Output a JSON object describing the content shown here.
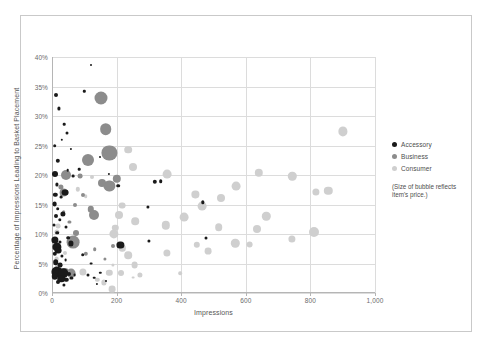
{
  "chart_data": {
    "type": "scatter",
    "title": "",
    "xlabel": "Impressions",
    "ylabel": "Percentage of Impressions Leading to Basket Placement",
    "xlim": [
      0,
      1000
    ],
    "ylim": [
      0,
      0.4
    ],
    "xticks": [
      0,
      200,
      400,
      600,
      800,
      1000
    ],
    "xtick_labels": [
      "0",
      "200",
      "400",
      "600",
      "800",
      "1,000"
    ],
    "yticks": [
      0,
      5,
      10,
      15,
      20,
      25,
      30,
      35,
      40
    ],
    "ytick_labels": [
      "0%",
      "5%",
      "10%",
      "15%",
      "20%",
      "25%",
      "30%",
      "35%",
      "40%"
    ],
    "grid": true,
    "legend_position": "right",
    "size_encoding": "bubble radius reflects item's price",
    "series": [
      {
        "name": "Accessory",
        "color": "#1a1a1a",
        "points": [
          {
            "x": 12,
            "y": 33.5,
            "r": 2.0
          },
          {
            "x": 22,
            "y": 31.3,
            "r": 1.6
          },
          {
            "x": 38,
            "y": 28.6,
            "r": 1.3
          },
          {
            "x": 45,
            "y": 27.2,
            "r": 1.5
          },
          {
            "x": 30,
            "y": 26.0,
            "r": 1.2
          },
          {
            "x": 8,
            "y": 25.0,
            "r": 1.8
          },
          {
            "x": 18,
            "y": 22.4,
            "r": 2.2
          },
          {
            "x": 8,
            "y": 20.2,
            "r": 3.0
          },
          {
            "x": 48,
            "y": 20.8,
            "r": 1.3
          },
          {
            "x": 14,
            "y": 18.4,
            "r": 1.6
          },
          {
            "x": 10,
            "y": 16.6,
            "r": 2.2
          },
          {
            "x": 40,
            "y": 17.0,
            "r": 3.4
          },
          {
            "x": 28,
            "y": 16.2,
            "r": 1.4
          },
          {
            "x": 8,
            "y": 15.1,
            "r": 2.4
          },
          {
            "x": 18,
            "y": 14.3,
            "r": 1.8
          },
          {
            "x": 34,
            "y": 13.4,
            "r": 2.6
          },
          {
            "x": 12,
            "y": 13.0,
            "r": 2.0
          },
          {
            "x": 24,
            "y": 12.4,
            "r": 1.7
          },
          {
            "x": 6,
            "y": 11.6,
            "r": 1.5
          },
          {
            "x": 16,
            "y": 10.2,
            "r": 1.8
          },
          {
            "x": 10,
            "y": 9.0,
            "r": 3.6
          },
          {
            "x": 26,
            "y": 8.6,
            "r": 1.5
          },
          {
            "x": 14,
            "y": 7.8,
            "r": 4.6
          },
          {
            "x": 20,
            "y": 7.2,
            "r": 3.4
          },
          {
            "x": 8,
            "y": 6.6,
            "r": 2.2
          },
          {
            "x": 30,
            "y": 6.3,
            "r": 1.6
          },
          {
            "x": 42,
            "y": 5.6,
            "r": 1.4
          },
          {
            "x": 12,
            "y": 5.2,
            "r": 2.8
          },
          {
            "x": 24,
            "y": 4.7,
            "r": 2.4
          },
          {
            "x": 16,
            "y": 3.6,
            "r": 5.6
          },
          {
            "x": 34,
            "y": 3.4,
            "r": 4.8
          },
          {
            "x": 52,
            "y": 3.2,
            "r": 2.0
          },
          {
            "x": 8,
            "y": 2.8,
            "r": 3.2
          },
          {
            "x": 28,
            "y": 2.4,
            "r": 3.8
          },
          {
            "x": 44,
            "y": 2.2,
            "r": 2.2
          },
          {
            "x": 60,
            "y": 2.6,
            "r": 1.6
          },
          {
            "x": 70,
            "y": 3.0,
            "r": 1.4
          },
          {
            "x": 20,
            "y": 1.8,
            "r": 2.0
          },
          {
            "x": 38,
            "y": 1.4,
            "r": 1.6
          },
          {
            "x": 95,
            "y": 6.5,
            "r": 1.8
          },
          {
            "x": 120,
            "y": 5.0,
            "r": 1.4
          },
          {
            "x": 112,
            "y": 3.0,
            "r": 1.5
          },
          {
            "x": 130,
            "y": 2.6,
            "r": 1.3
          },
          {
            "x": 150,
            "y": 3.4,
            "r": 1.2
          },
          {
            "x": 140,
            "y": 1.6,
            "r": 1.1
          },
          {
            "x": 168,
            "y": 2.0,
            "r": 1.0
          },
          {
            "x": 212,
            "y": 8.2,
            "r": 3.6
          },
          {
            "x": 205,
            "y": 18.2,
            "r": 1.8
          },
          {
            "x": 318,
            "y": 18.8,
            "r": 2.2
          },
          {
            "x": 336,
            "y": 18.9,
            "r": 1.8
          },
          {
            "x": 296,
            "y": 14.6,
            "r": 1.6
          },
          {
            "x": 300,
            "y": 8.8,
            "r": 1.6
          },
          {
            "x": 466,
            "y": 15.4,
            "r": 1.7
          },
          {
            "x": 478,
            "y": 9.3,
            "r": 1.5
          },
          {
            "x": 66,
            "y": 19.8,
            "r": 1.4
          },
          {
            "x": 84,
            "y": 21.0,
            "r": 1.3
          },
          {
            "x": 100,
            "y": 34.2,
            "r": 1.2
          },
          {
            "x": 58,
            "y": 24.4,
            "r": 1.1
          },
          {
            "x": 120,
            "y": 38.6,
            "r": 1.0
          },
          {
            "x": 150,
            "y": 23.0,
            "r": 1.0
          },
          {
            "x": 176,
            "y": 20.2,
            "r": 1.1
          },
          {
            "x": 58,
            "y": 8.4,
            "r": 2.6
          },
          {
            "x": 50,
            "y": 9.4,
            "r": 1.8
          },
          {
            "x": 44,
            "y": 11.2,
            "r": 1.5
          }
        ]
      },
      {
        "name": "Business",
        "color": "#8c8c8c",
        "points": [
          {
            "x": 152,
            "y": 33.0,
            "r": 6.5
          },
          {
            "x": 166,
            "y": 27.8,
            "r": 5.8
          },
          {
            "x": 178,
            "y": 23.7,
            "r": 7.6
          },
          {
            "x": 112,
            "y": 22.6,
            "r": 6.0
          },
          {
            "x": 42,
            "y": 20.0,
            "r": 5.0
          },
          {
            "x": 200,
            "y": 19.4,
            "r": 4.2
          },
          {
            "x": 178,
            "y": 18.2,
            "r": 5.6
          },
          {
            "x": 155,
            "y": 18.6,
            "r": 4.0
          },
          {
            "x": 36,
            "y": 17.0,
            "r": 4.4
          },
          {
            "x": 28,
            "y": 18.0,
            "r": 2.6
          },
          {
            "x": 130,
            "y": 13.2,
            "r": 5.0
          },
          {
            "x": 120,
            "y": 14.2,
            "r": 3.2
          },
          {
            "x": 66,
            "y": 8.6,
            "r": 6.4
          },
          {
            "x": 74,
            "y": 10.2,
            "r": 3.0
          },
          {
            "x": 60,
            "y": 3.4,
            "r": 4.4
          },
          {
            "x": 40,
            "y": 3.6,
            "r": 4.0
          },
          {
            "x": 96,
            "y": 16.6,
            "r": 2.0
          },
          {
            "x": 104,
            "y": 6.6,
            "r": 2.2
          },
          {
            "x": 88,
            "y": 19.8,
            "r": 2.4
          },
          {
            "x": 72,
            "y": 15.0,
            "r": 2.0
          },
          {
            "x": 132,
            "y": 7.4,
            "r": 1.8
          },
          {
            "x": 164,
            "y": 5.8,
            "r": 1.6
          },
          {
            "x": 190,
            "y": 8.0,
            "r": 2.0
          },
          {
            "x": 36,
            "y": 13.8,
            "r": 1.8
          },
          {
            "x": 54,
            "y": 12.0,
            "r": 1.6
          }
        ]
      },
      {
        "name": "Consumer",
        "color": "#cfcfcf",
        "points": [
          {
            "x": 900,
            "y": 27.4,
            "r": 4.6
          },
          {
            "x": 640,
            "y": 20.4,
            "r": 4.2
          },
          {
            "x": 744,
            "y": 19.8,
            "r": 4.2
          },
          {
            "x": 356,
            "y": 20.1,
            "r": 4.4
          },
          {
            "x": 236,
            "y": 24.3,
            "r": 3.8
          },
          {
            "x": 252,
            "y": 21.3,
            "r": 4.0
          },
          {
            "x": 570,
            "y": 18.1,
            "r": 4.4
          },
          {
            "x": 816,
            "y": 17.2,
            "r": 3.6
          },
          {
            "x": 856,
            "y": 17.3,
            "r": 4.2
          },
          {
            "x": 444,
            "y": 16.7,
            "r": 3.6
          },
          {
            "x": 524,
            "y": 16.1,
            "r": 4.0
          },
          {
            "x": 464,
            "y": 14.7,
            "r": 4.4
          },
          {
            "x": 216,
            "y": 14.8,
            "r": 3.4
          },
          {
            "x": 664,
            "y": 13.0,
            "r": 4.2
          },
          {
            "x": 408,
            "y": 12.8,
            "r": 4.4
          },
          {
            "x": 258,
            "y": 12.2,
            "r": 3.8
          },
          {
            "x": 206,
            "y": 13.3,
            "r": 4.0
          },
          {
            "x": 352,
            "y": 11.5,
            "r": 4.2
          },
          {
            "x": 516,
            "y": 11.2,
            "r": 3.8
          },
          {
            "x": 636,
            "y": 10.9,
            "r": 4.0
          },
          {
            "x": 812,
            "y": 10.4,
            "r": 5.0
          },
          {
            "x": 196,
            "y": 11.0,
            "r": 3.2
          },
          {
            "x": 192,
            "y": 10.0,
            "r": 4.6
          },
          {
            "x": 744,
            "y": 9.2,
            "r": 3.6
          },
          {
            "x": 568,
            "y": 8.4,
            "r": 4.2
          },
          {
            "x": 612,
            "y": 8.2,
            "r": 3.4
          },
          {
            "x": 448,
            "y": 8.2,
            "r": 3.2
          },
          {
            "x": 484,
            "y": 7.1,
            "r": 3.4
          },
          {
            "x": 356,
            "y": 6.8,
            "r": 3.6
          },
          {
            "x": 236,
            "y": 6.4,
            "r": 3.8
          },
          {
            "x": 218,
            "y": 7.6,
            "r": 3.2
          },
          {
            "x": 256,
            "y": 4.7,
            "r": 3.4
          },
          {
            "x": 214,
            "y": 3.4,
            "r": 3.0
          },
          {
            "x": 272,
            "y": 3.0,
            "r": 2.6
          },
          {
            "x": 178,
            "y": 3.4,
            "r": 3.2
          },
          {
            "x": 186,
            "y": 0.6,
            "r": 3.4
          },
          {
            "x": 160,
            "y": 1.8,
            "r": 2.6
          },
          {
            "x": 140,
            "y": 2.2,
            "r": 2.2
          },
          {
            "x": 96,
            "y": 3.6,
            "r": 3.6
          },
          {
            "x": 20,
            "y": 11.4,
            "r": 2.4
          },
          {
            "x": 16,
            "y": 10.4,
            "r": 2.6
          },
          {
            "x": 14,
            "y": 5.8,
            "r": 2.4
          },
          {
            "x": 20,
            "y": 4.2,
            "r": 3.4
          },
          {
            "x": 40,
            "y": 6.8,
            "r": 2.0
          },
          {
            "x": 80,
            "y": 17.6,
            "r": 2.2
          },
          {
            "x": 104,
            "y": 16.4,
            "r": 1.8
          },
          {
            "x": 124,
            "y": 19.6,
            "r": 2.0
          },
          {
            "x": 396,
            "y": 3.4,
            "r": 1.8
          },
          {
            "x": 188,
            "y": 4.8,
            "r": 1.6
          },
          {
            "x": 250,
            "y": 2.6,
            "r": 1.4
          }
        ]
      }
    ]
  },
  "legend": {
    "items": [
      {
        "label": "Accessory",
        "color": "#1a1a1a"
      },
      {
        "label": "Business",
        "color": "#8c8c8c"
      },
      {
        "label": "Consumer",
        "color": "#cfcfcf"
      }
    ],
    "note": "(Size of bubble reflects item's price.)"
  }
}
